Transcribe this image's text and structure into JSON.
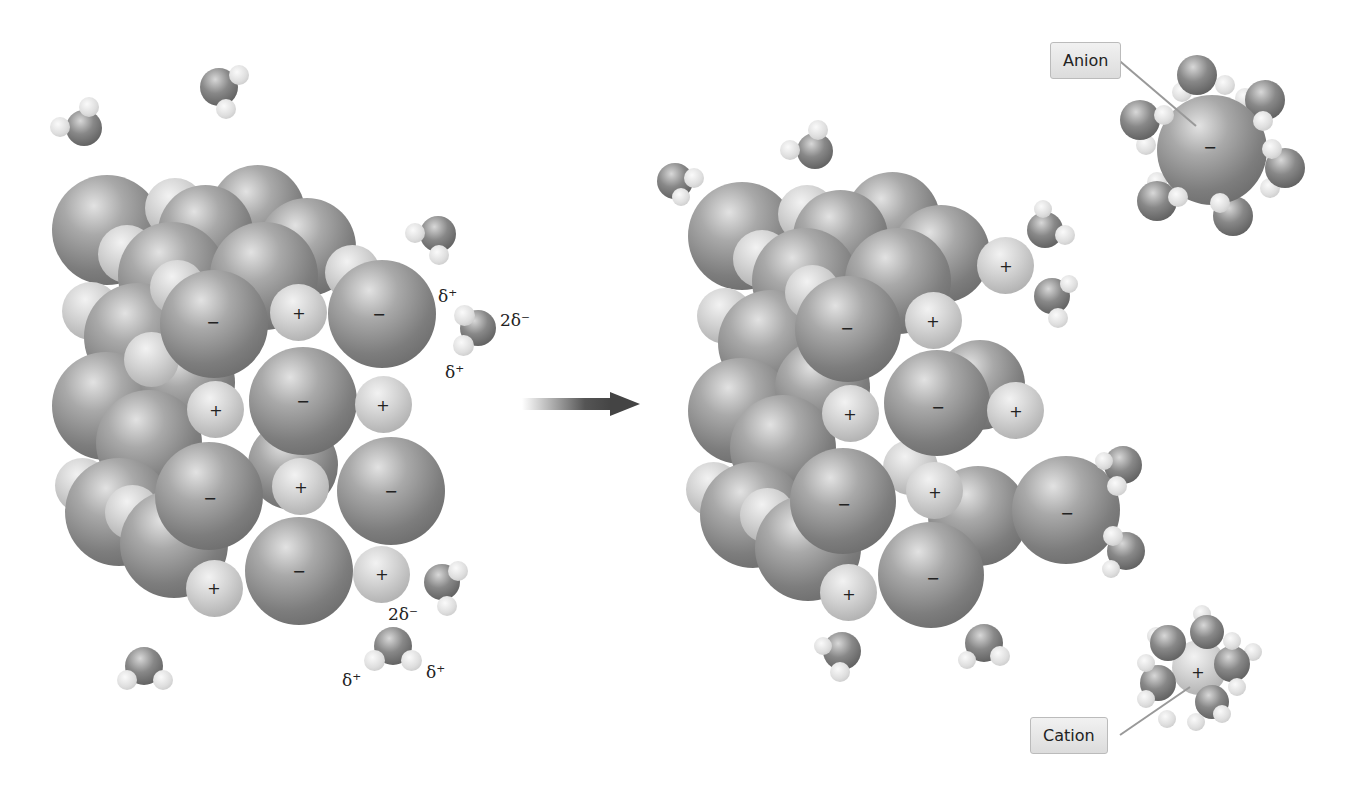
{
  "figure": {
    "arrow_label": "",
    "callouts": {
      "anion": "Anion",
      "cation": "Cation"
    },
    "charges": {
      "plus": "+",
      "minus": "−"
    },
    "water_labels": {
      "delta_plus": "δ⁺",
      "two_delta_minus": "2δ⁻"
    },
    "colors": {
      "anion_sphere": "#7d7d7d",
      "cation_sphere": "#d2d2d2",
      "callout_bg": "#e6e6e6",
      "arrow": "#444444"
    }
  }
}
